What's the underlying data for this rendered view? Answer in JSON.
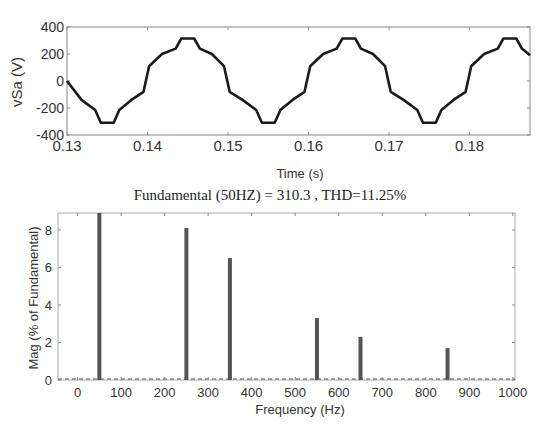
{
  "chart_data": [
    {
      "type": "line",
      "title": "",
      "xlabel": "Time (s)",
      "ylabel": "vSa (V)",
      "xlim": [
        0.13,
        0.1875
      ],
      "ylim": [
        -400,
        400
      ],
      "xticks": [
        "0.13",
        "0.14",
        "0.15",
        "0.16",
        "0.17",
        "0.18"
      ],
      "yticks": [
        "400",
        "200",
        "0",
        "-200",
        "-400"
      ],
      "grid": false,
      "series": [
        {
          "name": "vSa",
          "description": "Stepped multilevel sinusoidal voltage, 50 Hz, peak ~315 V, flat tops near +/-315 V",
          "x": [
            0.13,
            0.1318,
            0.1335,
            0.1342,
            0.1358,
            0.1365,
            0.138,
            0.1395,
            0.1402,
            0.1418,
            0.1435,
            0.1442,
            0.1458,
            0.1465,
            0.148,
            0.1495,
            0.1502,
            0.1518,
            0.1535,
            0.1542,
            0.1558,
            0.1565,
            0.158,
            0.1595,
            0.1602,
            0.1618,
            0.1635,
            0.1642,
            0.1658,
            0.1665,
            0.168,
            0.1695,
            0.1702,
            0.1718,
            0.1735,
            0.1742,
            0.1758,
            0.1765,
            0.178,
            0.1795,
            0.1802,
            0.1818,
            0.1835,
            0.1842,
            0.1858,
            0.1865,
            0.1875
          ],
          "y": [
            0,
            -140,
            -215,
            -310,
            -310,
            -215,
            -140,
            -80,
            110,
            200,
            240,
            315,
            315,
            240,
            200,
            110,
            -80,
            -140,
            -215,
            -310,
            -310,
            -215,
            -140,
            -80,
            110,
            200,
            240,
            315,
            315,
            240,
            200,
            110,
            -80,
            -140,
            -215,
            -310,
            -310,
            -215,
            -140,
            -80,
            110,
            200,
            240,
            315,
            315,
            240,
            190
          ]
        }
      ]
    },
    {
      "type": "bar",
      "title": "Fundamental (50HZ) = 310.3 , THD=11.25%",
      "xlabel": "Frequency (Hz)",
      "ylabel": "Mag (% of Fundamental)",
      "xlim": [
        -45,
        1005
      ],
      "ylim": [
        0,
        8.9
      ],
      "xticks": [
        "0",
        "100",
        "200",
        "300",
        "400",
        "500",
        "600",
        "700",
        "800",
        "900",
        "1000"
      ],
      "yticks": [
        "0",
        "2",
        "4",
        "6",
        "8"
      ],
      "grid": false,
      "categories": [
        50,
        250,
        350,
        550,
        650,
        850
      ],
      "values": [
        9.0,
        8.1,
        6.5,
        3.3,
        2.3,
        1.7
      ],
      "notes": "50 Hz bar clipped at top of axes; all other harmonics ~0"
    }
  ],
  "figure": {
    "top": {
      "ylabel": "vSa (V)",
      "xlabel": "Time (s)"
    },
    "bottom": {
      "title": "Fundamental (50HZ) = 310.3 , THD=11.25%",
      "xlabel": "Frequency (Hz)",
      "ylabel": "Mag (% of Fundamental)"
    }
  },
  "colors": {
    "line": "#1a1a1a",
    "bar": "#555555",
    "axis": "#888888",
    "text": "#333333"
  }
}
